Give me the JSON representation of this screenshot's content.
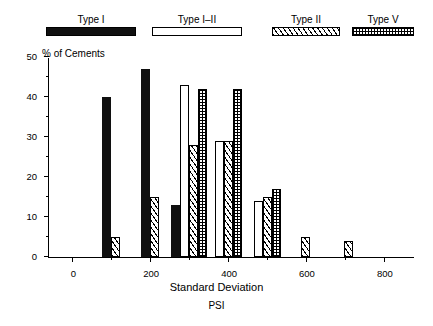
{
  "legend": {
    "items": [
      {
        "label": "Type I",
        "pattern": "solid",
        "x": 46,
        "w": 90
      },
      {
        "label": "Type I–II",
        "pattern": "open",
        "x": 152,
        "w": 90
      },
      {
        "label": "Type II",
        "pattern": "hatch",
        "x": 272,
        "w": 68
      },
      {
        "label": "Type V",
        "pattern": "check",
        "x": 352,
        "w": 62
      }
    ]
  },
  "chart_data": {
    "type": "bar",
    "title": "",
    "xlabel": "Standard Deviation",
    "xlabel2": "PSI",
    "ylabel": "% of Cements",
    "xlim": [
      -60,
      880
    ],
    "ylim": [
      0,
      50
    ],
    "grid": false,
    "legend_position": "top",
    "xticks": [
      0,
      200,
      400,
      600,
      800
    ],
    "xticks_minor": [
      100,
      300,
      500,
      700
    ],
    "yticks": [
      0,
      10,
      20,
      30,
      40,
      50
    ],
    "yticks_minor": [
      5,
      15,
      25,
      35,
      45
    ],
    "categories": [
      100,
      200,
      300,
      400,
      500,
      600,
      710
    ],
    "series": [
      {
        "name": "Type I",
        "pattern": "solid",
        "values": [
          40,
          47,
          13,
          0,
          0,
          0,
          0
        ]
      },
      {
        "name": "Type I–II",
        "pattern": "open",
        "values": [
          0,
          0,
          43,
          29,
          14,
          0,
          0
        ]
      },
      {
        "name": "Type II",
        "pattern": "hatch",
        "values": [
          5,
          15,
          28,
          29,
          15,
          5,
          4
        ]
      },
      {
        "name": "Type V",
        "pattern": "check",
        "values": [
          0,
          0,
          42,
          42,
          17,
          0,
          0
        ]
      }
    ],
    "bar_width": 9,
    "colors": {
      "ink": "#000000",
      "fill_solid": "#101010",
      "background": "#ffffff"
    }
  }
}
